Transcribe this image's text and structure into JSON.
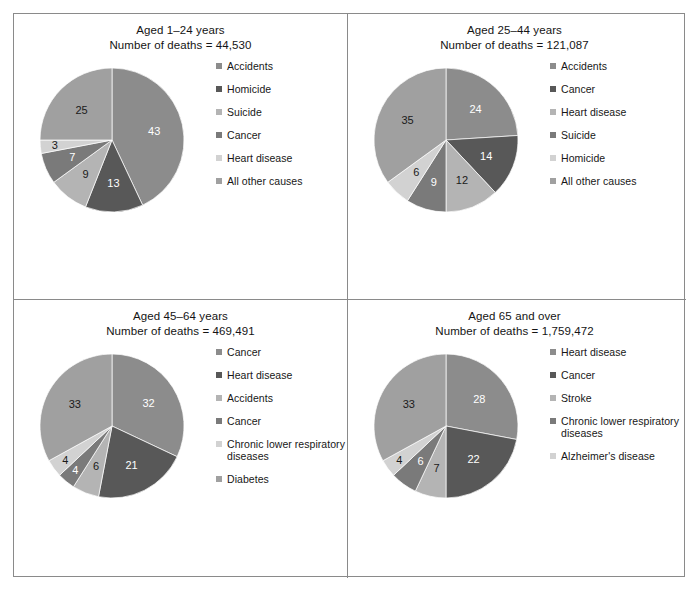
{
  "figure": {
    "panel_count": 4,
    "border_color": "#8a8a8a",
    "background": "#ffffff"
  },
  "palette": {
    "gray1": "#8c8c8c",
    "gray2": "#585858",
    "gray3": "#b4b4b4",
    "gray4": "#7a7a7a",
    "gray5": "#d2d2d2",
    "gray6": "#a0a0a0"
  },
  "chart_data": [
    {
      "type": "pie",
      "title": "Aged 1–24 years",
      "subtitle": "Number of deaths = 44,530",
      "categories": [
        "Accidents",
        "Homicide",
        "Suicide",
        "Cancer",
        "Heart disease",
        "All other causes"
      ],
      "values": [
        43,
        13,
        9,
        7,
        3,
        25
      ],
      "labels": [
        "43",
        "13",
        "9",
        "7",
        "3",
        "25"
      ],
      "colors": [
        "#8c8c8c",
        "#585858",
        "#b4b4b4",
        "#7a7a7a",
        "#d2d2d2",
        "#a0a0a0"
      ],
      "label_colors": [
        "light",
        "light",
        "dark",
        "light",
        "dark",
        "dark"
      ],
      "legend_position": "right",
      "start_angle_deg": 0,
      "direction": "clockwise"
    },
    {
      "type": "pie",
      "title": "Aged 25–44 years",
      "subtitle": "Number of deaths = 121,087",
      "categories": [
        "Accidents",
        "Cancer",
        "Heart disease",
        "Suicide",
        "Homicide",
        "All other causes"
      ],
      "values": [
        24,
        14,
        12,
        9,
        6,
        35
      ],
      "labels": [
        "24",
        "14",
        "12",
        "9",
        "6",
        "35"
      ],
      "colors": [
        "#8c8c8c",
        "#585858",
        "#b4b4b4",
        "#7a7a7a",
        "#d2d2d2",
        "#a0a0a0"
      ],
      "label_colors": [
        "light",
        "light",
        "dark",
        "light",
        "dark",
        "dark"
      ],
      "legend_position": "right",
      "start_angle_deg": 0,
      "direction": "clockwise"
    },
    {
      "type": "pie",
      "title": "Aged 45–64 years",
      "subtitle": "Number of deaths = 469,491",
      "categories": [
        "Cancer",
        "Heart disease",
        "Accidents",
        "Cancer",
        "Chronic lower respiratory diseases",
        "Diabetes"
      ],
      "values": [
        32,
        21,
        6,
        4,
        4,
        33
      ],
      "labels": [
        "32",
        "21",
        "6",
        "4",
        "4",
        "33"
      ],
      "colors": [
        "#8c8c8c",
        "#585858",
        "#b4b4b4",
        "#7a7a7a",
        "#d2d2d2",
        "#a0a0a0"
      ],
      "label_colors": [
        "light",
        "light",
        "dark",
        "light",
        "dark",
        "dark"
      ],
      "legend_position": "right",
      "start_angle_deg": 0,
      "direction": "clockwise"
    },
    {
      "type": "pie",
      "title": "Aged 65 and over",
      "subtitle": "Number of deaths = 1,759,472",
      "categories": [
        "Heart disease",
        "Cancer",
        "Stroke",
        "Chronic lower respiratory diseases",
        "Alzheimer's disease"
      ],
      "values": [
        28,
        22,
        7,
        6,
        4,
        33
      ],
      "labels": [
        "28",
        "22",
        "7",
        "6",
        "4",
        "33"
      ],
      "colors": [
        "#8c8c8c",
        "#585858",
        "#b4b4b4",
        "#7a7a7a",
        "#d2d2d2",
        "#a0a0a0"
      ],
      "label_colors": [
        "light",
        "light",
        "dark",
        "light",
        "dark",
        "dark"
      ],
      "legend_position": "right",
      "start_angle_deg": 0,
      "direction": "clockwise"
    }
  ]
}
